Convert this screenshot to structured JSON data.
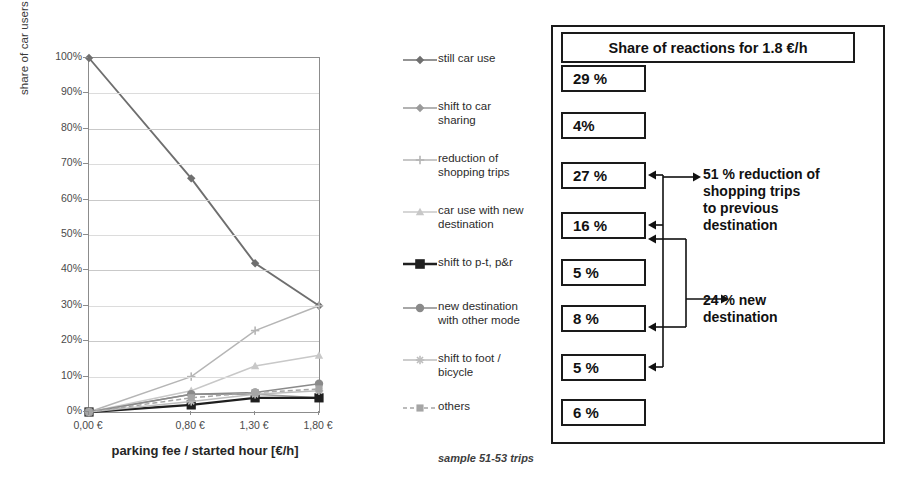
{
  "chart_data": {
    "type": "line",
    "title": "",
    "xlabel": "parking fee / started hour [€/h]",
    "ylabel": "share of car users for shopping [%]",
    "x": [
      0.0,
      0.8,
      1.3,
      1.8
    ],
    "xticklabels": [
      "0,00 €",
      "0,80 €",
      "1,30 €",
      "1,80 €"
    ],
    "yticklabels": [
      "100%",
      "90%",
      "80%",
      "70%",
      "60%",
      "50%",
      "40%",
      "30%",
      "20%",
      "10%",
      "0%"
    ],
    "ylim": [
      0,
      100
    ],
    "ytick_step": 10,
    "grid": true,
    "legend_position": "right",
    "series": [
      {
        "name": "still car use",
        "values": [
          100,
          66,
          42,
          30
        ],
        "color": "#6f6f6f",
        "marker": "diamond",
        "dash": false
      },
      {
        "name": "shift to car sharing",
        "values": [
          0,
          5,
          5,
          4
        ],
        "color": "#9a9a9a",
        "marker": "diamond",
        "dash": false
      },
      {
        "name": "reduction of shopping trips",
        "values": [
          0,
          10,
          23,
          30
        ],
        "color": "#b5b5b5",
        "marker": "plus",
        "dash": false
      },
      {
        "name": "car use with new destination",
        "values": [
          0,
          6,
          13,
          16
        ],
        "color": "#c8c8c8",
        "marker": "triangle",
        "dash": false
      },
      {
        "name": "shift to p-t, p&r",
        "values": [
          0,
          2,
          4,
          4
        ],
        "color": "#1f1f1f",
        "marker": "square",
        "dash": false
      },
      {
        "name": "new destination with other mode",
        "values": [
          0,
          5,
          5.5,
          8
        ],
        "color": "#8a8a8a",
        "marker": "circle",
        "dash": false
      },
      {
        "name": "shift to foot / bicycle",
        "values": [
          0,
          3,
          5,
          6
        ],
        "color": "#bdbdbd",
        "marker": "star",
        "dash": false
      },
      {
        "name": "others",
        "values": [
          0,
          4,
          5.5,
          6.5
        ],
        "color": "#a5a5a5",
        "marker": "square-small",
        "dash": true
      }
    ],
    "sample_note": "sample 51-53 trips"
  },
  "legend": {
    "items": [
      {
        "label": "still car use"
      },
      {
        "label": "shift to car\nsharing"
      },
      {
        "label": "reduction of\nshopping trips"
      },
      {
        "label": "car use with new\ndestination"
      },
      {
        "label": "shift to p-t, p&r"
      },
      {
        "label": "new destination\nwith other mode"
      },
      {
        "label": "shift to foot /\nbicycle"
      },
      {
        "label": "others"
      }
    ]
  },
  "panel": {
    "title": "Share of reactions for 1.8 €/h",
    "boxes": [
      {
        "value": "29 %"
      },
      {
        "value": "4%"
      },
      {
        "value": "27 %"
      },
      {
        "value": "16 %"
      },
      {
        "value": "5 %"
      },
      {
        "value": "8 %"
      },
      {
        "value": "5 %"
      },
      {
        "value": "6 %"
      }
    ],
    "annotations": [
      {
        "text": "51 % reduction of\n       shopping trips\n       to previous\n       destination"
      },
      {
        "text": "24 % new\n       destination"
      }
    ]
  },
  "colors": {
    "ink": "#1a1a1a",
    "grid": "#c9c9c9",
    "axis": "#8c8c8c"
  }
}
